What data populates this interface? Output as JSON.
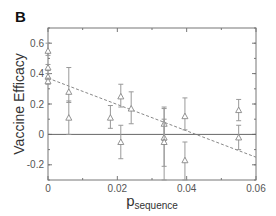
{
  "panel_label": "B",
  "chart_data": {
    "type": "scatter",
    "title": "",
    "xlabel": "p",
    "xlabel_subscript": "sequence",
    "ylabel": "Vaccine Efficacy",
    "xlim": [
      0,
      0.06
    ],
    "ylim": [
      -0.3,
      0.7
    ],
    "xticks": [
      0,
      0.02,
      0.04,
      0.06
    ],
    "xtick_labels": [
      "0",
      "0.02",
      "0.04",
      "0.06"
    ],
    "yticks": [
      -0.2,
      0,
      0.2,
      0.4,
      0.6
    ],
    "ytick_labels": [
      "-0.2",
      "0",
      "0.2",
      "0.4",
      "0.6"
    ],
    "grid": false,
    "reference_line": {
      "y": 0
    },
    "trend_line": {
      "style": "dashed",
      "x": [
        0,
        0.06
      ],
      "y": [
        0.37,
        -0.15
      ]
    },
    "marker": "triangle-open",
    "points": [
      {
        "x": 0.0,
        "y": 0.55,
        "lo": 0.52,
        "hi": 0.6
      },
      {
        "x": 0.0,
        "y": 0.44,
        "lo": 0.42,
        "hi": 0.46
      },
      {
        "x": 0.0,
        "y": 0.38,
        "lo": 0.36,
        "hi": 0.4
      },
      {
        "x": 0.0,
        "y": 0.35,
        "lo": 0.33,
        "hi": 0.37
      },
      {
        "x": 0.006,
        "y": 0.28,
        "lo": 0.21,
        "hi": 0.44
      },
      {
        "x": 0.006,
        "y": 0.11,
        "lo": 0.0,
        "hi": 0.22
      },
      {
        "x": 0.018,
        "y": 0.11,
        "lo": 0.04,
        "hi": 0.19
      },
      {
        "x": 0.021,
        "y": 0.25,
        "lo": 0.18,
        "hi": 0.33
      },
      {
        "x": 0.021,
        "y": -0.05,
        "lo": -0.16,
        "hi": 0.06
      },
      {
        "x": 0.024,
        "y": 0.17,
        "lo": 0.07,
        "hi": 0.28
      },
      {
        "x": 0.0335,
        "y": 0.07,
        "lo": -0.04,
        "hi": 0.18
      },
      {
        "x": 0.0335,
        "y": -0.02,
        "lo": -0.3,
        "hi": 0.17
      },
      {
        "x": 0.0335,
        "y": -0.05,
        "lo": -0.21,
        "hi": 0.1
      },
      {
        "x": 0.0395,
        "y": 0.12,
        "lo": 0.03,
        "hi": 0.24
      },
      {
        "x": 0.0395,
        "y": -0.17,
        "lo": -0.3,
        "hi": -0.05
      },
      {
        "x": 0.055,
        "y": 0.16,
        "lo": 0.09,
        "hi": 0.23
      },
      {
        "x": 0.055,
        "y": -0.02,
        "lo": -0.1,
        "hi": 0.06
      }
    ]
  }
}
